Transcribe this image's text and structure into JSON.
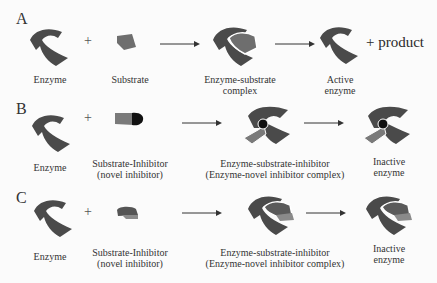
{
  "colors": {
    "enzyme": "#4a4a4a",
    "substrate": "#6e6e6e",
    "substrate_light": "#8a8a8a",
    "inhibitor_dark": "#111111",
    "background": "#fbfbfb"
  },
  "panels": [
    {
      "label": "A",
      "plus": "+",
      "stages": [
        {
          "lines": [
            "Enzyme"
          ]
        },
        {
          "lines": [
            "Substrate"
          ]
        },
        {
          "lines": [
            "Enzyme-substrate",
            "complex"
          ]
        },
        {
          "lines": [
            "Active",
            "enzyme"
          ]
        }
      ],
      "product": "+ product"
    },
    {
      "label": "B",
      "plus": "+",
      "stages": [
        {
          "lines": [
            "Enzyme"
          ]
        },
        {
          "lines": [
            "Substrate-Inhibitor",
            "(novel inhibitor)"
          ]
        },
        {
          "lines": [
            "Enzyme-substrate-inhibitor",
            "(Enzyme-novel inhibitor complex)"
          ]
        },
        {
          "lines": [
            "Inactive",
            "enzyme"
          ]
        }
      ]
    },
    {
      "label": "C",
      "plus": "+",
      "stages": [
        {
          "lines": [
            "Enzyme"
          ]
        },
        {
          "lines": [
            "Substrate-Inhibitor",
            "(novel inhibitor)"
          ]
        },
        {
          "lines": [
            "Enzyme-substrate-inhibitor",
            "(Enzyme-novel inhibitor complex)"
          ]
        },
        {
          "lines": [
            "Inactive",
            "enzyme"
          ]
        }
      ]
    }
  ]
}
